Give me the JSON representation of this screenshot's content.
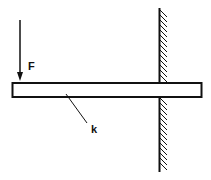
{
  "diagram": {
    "labels": {
      "force": "F",
      "stiffness": "k"
    },
    "colors": {
      "stroke": "#111111",
      "background": "#ffffff"
    }
  }
}
